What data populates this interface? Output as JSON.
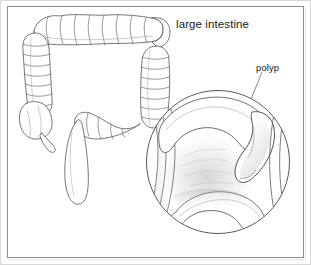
{
  "figure": {
    "kind": "medical-illustration",
    "width": 311,
    "height": 265,
    "background_color": "#ffffff",
    "ink_color": "#5a5a5a",
    "text_color": "#1b1b1b",
    "frame": {
      "border_color": "#8d8d8d",
      "outer_edge_color": "#d8d8d8",
      "shadow_color": "#e2e2e2"
    }
  },
  "labels": {
    "title": "large intestine",
    "callout": "polyp"
  },
  "anatomy": {
    "parts": [
      "transverse colon",
      "ascending colon",
      "descending colon",
      "cecum",
      "appendix",
      "sigmoid colon",
      "rectum"
    ]
  },
  "magnifier": {
    "center_x": 218,
    "center_y": 162,
    "radius": 72,
    "contents": [
      "intestinal wall",
      "lumen",
      "mucosal folds",
      "pedunculated polyp"
    ]
  },
  "leader_line": {
    "from_x": 262,
    "from_y": 72,
    "to_x": 238,
    "to_y": 130
  }
}
